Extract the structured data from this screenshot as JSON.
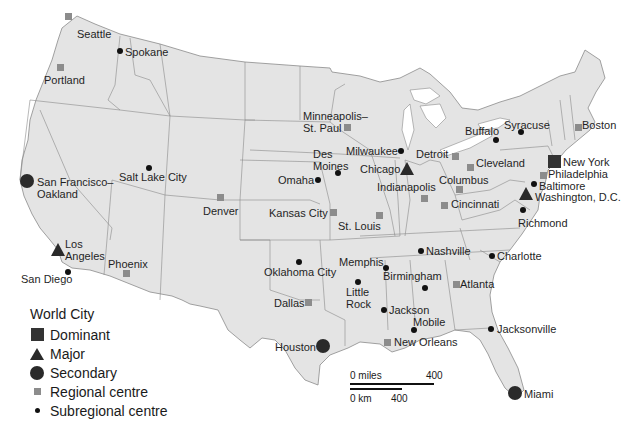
{
  "map": {
    "land_color": "#e4e4e4",
    "border_color": "#777777",
    "water_color": "#ffffff"
  },
  "legend": {
    "title": "World City",
    "items": [
      {
        "symbol": "square-large",
        "label": "Dominant",
        "color": "#333333"
      },
      {
        "symbol": "triangle",
        "label": "Major",
        "color": "#2a2a2a"
      },
      {
        "symbol": "circle-large",
        "label": "Secondary",
        "color": "#2a2a2a"
      },
      {
        "symbol": "square-small",
        "label": "Regional centre",
        "color": "#8c8c8c"
      },
      {
        "symbol": "dot",
        "label": "Subregional centre",
        "color": "#111111"
      }
    ]
  },
  "scale": {
    "miles_label": "0 miles",
    "miles_value": "400",
    "km_label": "0 km",
    "km_value": "400"
  },
  "cities": [
    {
      "name": "Seattle",
      "type": "regional"
    },
    {
      "name": "Spokane",
      "type": "subregional"
    },
    {
      "name": "Portland",
      "type": "regional"
    },
    {
      "name": "San Francisco–",
      "name2": "Oakland",
      "type": "secondary"
    },
    {
      "name": "Salt Lake City",
      "type": "subregional"
    },
    {
      "name": "Denver",
      "type": "regional"
    },
    {
      "name": "Los",
      "name2": "Angeles",
      "type": "major"
    },
    {
      "name": "San Diego",
      "type": "subregional"
    },
    {
      "name": "Phoenix",
      "type": "regional"
    },
    {
      "name": "Minneapolis–",
      "name2": "St. Paul",
      "type": "regional"
    },
    {
      "name": "Des",
      "name2": "Moines",
      "type": "subregional"
    },
    {
      "name": "Omaha",
      "type": "subregional"
    },
    {
      "name": "Kansas City",
      "type": "regional"
    },
    {
      "name": "St. Louis",
      "type": "regional"
    },
    {
      "name": "Milwaukee",
      "type": "subregional"
    },
    {
      "name": "Chicago",
      "type": "major"
    },
    {
      "name": "Indianapolis",
      "type": "regional"
    },
    {
      "name": "Detroit",
      "type": "regional"
    },
    {
      "name": "Cleveland",
      "type": "regional"
    },
    {
      "name": "Columbus",
      "type": "regional"
    },
    {
      "name": "Cincinnati",
      "type": "regional"
    },
    {
      "name": "Buffalo",
      "type": "subregional"
    },
    {
      "name": "Syracuse",
      "type": "subregional"
    },
    {
      "name": "Boston",
      "type": "regional"
    },
    {
      "name": "New York",
      "type": "dominant"
    },
    {
      "name": "Philadelphia",
      "type": "regional"
    },
    {
      "name": "Baltimore",
      "type": "subregional"
    },
    {
      "name": "Washington, D.C.",
      "type": "major"
    },
    {
      "name": "Richmond",
      "type": "subregional"
    },
    {
      "name": "Oklahoma City",
      "type": "subregional"
    },
    {
      "name": "Dallas",
      "type": "regional"
    },
    {
      "name": "Houston",
      "type": "secondary"
    },
    {
      "name": "Memphis",
      "type": "subregional"
    },
    {
      "name": "Little",
      "name2": "Rock",
      "type": "subregional"
    },
    {
      "name": "Nashville",
      "type": "subregional"
    },
    {
      "name": "Birmingham",
      "type": "subregional"
    },
    {
      "name": "Jackson",
      "type": "subregional"
    },
    {
      "name": "Mobile",
      "type": "subregional"
    },
    {
      "name": "New Orleans",
      "type": "regional"
    },
    {
      "name": "Atlanta",
      "type": "regional"
    },
    {
      "name": "Charlotte",
      "type": "subregional"
    },
    {
      "name": "Jacksonville",
      "type": "subregional"
    },
    {
      "name": "Miami",
      "type": "secondary"
    }
  ]
}
